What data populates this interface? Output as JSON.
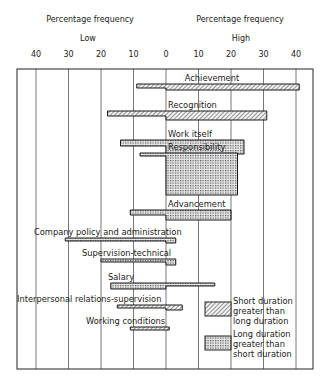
{
  "header": {
    "left_title": "Percentage frequency",
    "right_title": "Percentage frequency",
    "left_sub": "Low",
    "right_sub": "High"
  },
  "legend": {
    "items": [
      {
        "lines": [
          "Short duration",
          "greater than",
          "long duration"
        ],
        "pattern": "hatch"
      },
      {
        "lines": [
          "Long duration",
          "greater than",
          "short duration"
        ],
        "pattern": "dots"
      }
    ]
  },
  "chart_data": {
    "type": "bar",
    "orientation": "horizontal-diverging",
    "title": "",
    "xlabel_left": "Percentage frequency — Low",
    "xlabel_right": "Percentage frequency — High",
    "x_ticks_low": [
      40,
      30,
      20,
      10,
      0
    ],
    "x_ticks_high": [
      10,
      20,
      30,
      40
    ],
    "xlim": [
      -44,
      46
    ],
    "grid": true,
    "legend_position": "lower-right inside",
    "categories": [
      "Achievement",
      "Recognition",
      "Work itself",
      "Responsibility",
      "Advancement",
      "Company policy and administration",
      "Supervision-technical",
      "Salary",
      "Interpersonal relations-supervision",
      "Working conditions"
    ],
    "series": [
      {
        "name": "Low (dissatisfier) percentage frequency",
        "values": [
          9,
          18,
          14,
          8,
          11,
          31,
          20,
          17,
          15,
          11
        ]
      },
      {
        "name": "High (satisfier) percentage frequency",
        "values": [
          41,
          31,
          24,
          22,
          20,
          3,
          3,
          15,
          5,
          1
        ]
      }
    ],
    "rows": [
      {
        "label": "Achievement",
        "low": 9,
        "high": 41,
        "long_low": 0,
        "long_high": 41,
        "short_h": 4,
        "long_h": 6,
        "label_x": 0,
        "y": 84,
        "dominant": "short"
      },
      {
        "label": "Recognition",
        "low": 18,
        "high": 31,
        "long_low": 0,
        "long_high": 31,
        "short_h": 5,
        "long_h": 9,
        "label_x": 0,
        "y": 111,
        "dominant": "short"
      },
      {
        "label": "Work itself",
        "low": 14,
        "high": 24,
        "long_low": 0,
        "long_high": 24,
        "short_h": 6,
        "long_h": 14,
        "label_x": 0,
        "y": 140,
        "dominant": "long"
      },
      {
        "label": "Responsibility",
        "low": 8,
        "high": 22,
        "long_low": 0,
        "long_high": 22,
        "short_h": 3,
        "long_h": 42,
        "label_x": 0,
        "y": 153,
        "dominant": "long"
      },
      {
        "label": "Advancement",
        "low": 11,
        "high": 20,
        "long_low": 0,
        "long_high": 20,
        "short_h": 5,
        "long_h": 10,
        "label_x": 0,
        "y": 210,
        "dominant": "long"
      },
      {
        "label": "Company policy and administration",
        "low": 31,
        "high": 3,
        "long_low": 0,
        "long_high": 3,
        "short_h": 3,
        "long_h": 5,
        "label_x": -31,
        "y": 238,
        "dominant": "long"
      },
      {
        "label": "Supervision-technical",
        "low": 20,
        "high": 3,
        "long_low": 0,
        "long_high": 3,
        "short_h": 3,
        "long_h": 6,
        "label_x": -15,
        "y": 259,
        "dominant": "long"
      },
      {
        "label": "Salary",
        "low": 17,
        "high": 15,
        "long_low": 17,
        "long_high": 0,
        "short_h": 3,
        "long_h": 6,
        "label_x": -5,
        "y": 283,
        "dominant": "long"
      },
      {
        "label": "Interpersonal relations-supervision",
        "low": 15,
        "high": 5,
        "long_low": 0,
        "long_high": 5,
        "short_h": 3,
        "long_h": 5,
        "label_x": -45,
        "y": 305,
        "dominant": "short"
      },
      {
        "label": "Working conditions",
        "low": 11,
        "high": 1,
        "long_low": 0,
        "long_high": 1,
        "short_h": 3,
        "long_h": 3,
        "label_x": -20,
        "y": 327,
        "dominant": "short"
      }
    ]
  }
}
